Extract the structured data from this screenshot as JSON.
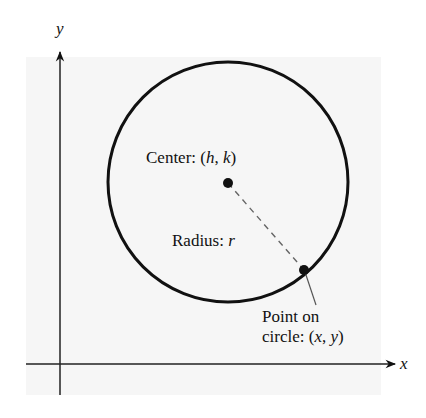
{
  "figure": {
    "type": "circle-diagram",
    "axes": {
      "x_label": "x",
      "y_label": "y"
    },
    "labels": {
      "center_prefix": "Center: (",
      "center_h": "h",
      "center_sep": ", ",
      "center_k": "k",
      "center_suffix": ")",
      "radius_prefix": "Radius: ",
      "radius_var": "r",
      "point_line1": "Point on",
      "point_line2_prefix": "circle: (",
      "point_x": "x",
      "point_sep": ", ",
      "point_y": "y",
      "point_suffix": ")"
    },
    "colors": {
      "ink": "#111111",
      "panel": "#f6f6f6",
      "dashed": "#666666",
      "leader": "#555555"
    }
  }
}
